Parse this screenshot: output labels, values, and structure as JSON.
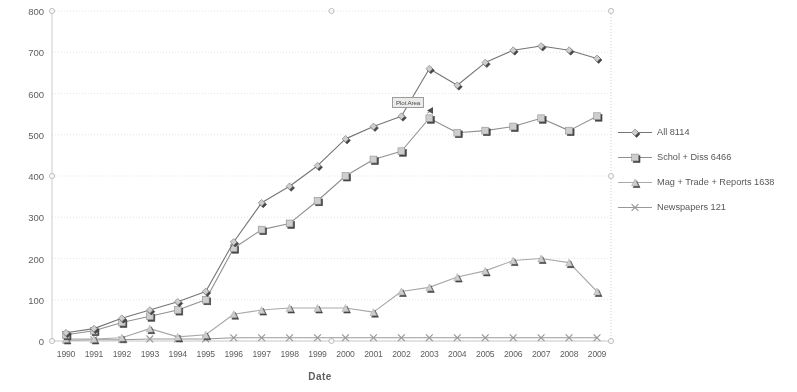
{
  "chart_data": {
    "type": "line",
    "title": "",
    "xlabel": "Date",
    "ylabel": "Quantity",
    "categories": [
      "1990",
      "1991",
      "1992",
      "1993",
      "1994",
      "1995",
      "1996",
      "1997",
      "1998",
      "1999",
      "2000",
      "2001",
      "2002",
      "2003",
      "2004",
      "2005",
      "2006",
      "2007",
      "2008",
      "2009"
    ],
    "ylim": [
      0,
      800
    ],
    "ytick_step": 100,
    "yticks": [
      "800",
      "700",
      "600",
      "500",
      "400",
      "300",
      "200",
      "100",
      "0"
    ],
    "grid": true,
    "legend_position": "right",
    "series": [
      {
        "name": "All 8114",
        "marker": "diamond",
        "color": "#6e6e6e",
        "values": [
          20,
          30,
          55,
          75,
          95,
          120,
          240,
          335,
          375,
          425,
          490,
          520,
          545,
          660,
          620,
          675,
          705,
          715,
          705,
          685
        ]
      },
      {
        "name": "Schol + Diss 6466",
        "marker": "square",
        "color": "#8c8c8c",
        "values": [
          15,
          25,
          45,
          60,
          75,
          100,
          225,
          270,
          285,
          340,
          400,
          440,
          460,
          540,
          505,
          510,
          520,
          540,
          510,
          545
        ]
      },
      {
        "name": "Mag + Trade + Reports 1638",
        "marker": "triangle",
        "color": "#a8a8a8",
        "values": [
          5,
          5,
          8,
          30,
          10,
          15,
          65,
          75,
          80,
          80,
          80,
          70,
          120,
          130,
          155,
          170,
          195,
          200,
          190,
          120
        ]
      },
      {
        "name": "Newspapers 121",
        "marker": "cross",
        "color": "#969696",
        "values": [
          2,
          3,
          3,
          5,
          5,
          5,
          8,
          8,
          8,
          8,
          8,
          8,
          8,
          8,
          8,
          8,
          8,
          8,
          8,
          8
        ]
      }
    ],
    "annotations": [
      {
        "text": "Plot Area",
        "x_category": "2003",
        "y_value": 545
      }
    ]
  },
  "legend": {
    "items": [
      {
        "label": "All 8114",
        "marker": "diamond"
      },
      {
        "label": "Schol + Diss 6466",
        "marker": "square"
      },
      {
        "label": "Mag + Trade + Reports 1638",
        "marker": "triangle"
      },
      {
        "label": "Newspapers 121",
        "marker": "cross"
      }
    ]
  },
  "axes": {
    "y_title": "Quantity",
    "x_title": "Date"
  },
  "colors": {
    "series1": "#6e6e6e",
    "series2": "#8c8c8c",
    "series3": "#a8a8a8",
    "series4": "#969696",
    "grid": "#dcdcdc",
    "axis": "#c8c8c8",
    "text": "#4a4a4a"
  }
}
